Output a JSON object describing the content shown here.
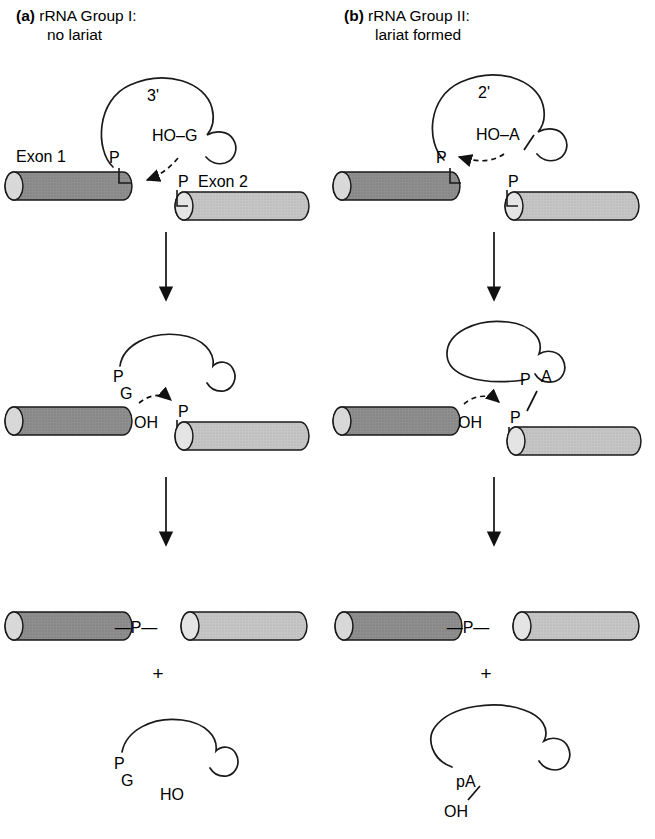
{
  "figure": {
    "type": "mechanism-diagram",
    "panel_count": 2,
    "stage_count": 3
  },
  "colors": {
    "exon1_fill": "#8f8f8f",
    "exon2_fill": "#c2c2c2",
    "cap_fill": "#d8d8d8",
    "stroke": "#1a1a1a",
    "background": "#ffffff"
  },
  "panels": [
    {
      "tag": "(a)",
      "title_line1": "rRNA Group I:",
      "title_line2": "no lariat",
      "stage1": {
        "loop_label": "3'",
        "nucleophile": "HO–G",
        "phosphate_left": "P",
        "phosphate_right": "P",
        "exon1_label": "Exon 1",
        "exon2_label": "Exon 2"
      },
      "stage2": {
        "intron_end_top": "P",
        "intron_end_bottom": "G",
        "exon1_end": "OH",
        "phosphate": "P"
      },
      "stage3": {
        "linkage": "—P—",
        "plus": "+",
        "released_top": "P",
        "released_bottom": "G",
        "released_end": "HO"
      }
    },
    {
      "tag": "(b)",
      "title_line1": "rRNA Group II:",
      "title_line2": "lariat formed",
      "stage1": {
        "loop_label": "2'",
        "nucleophile": "HO–A",
        "phosphate_left": "P",
        "phosphate_right": "P"
      },
      "stage2": {
        "branch_p": "P",
        "branch_a": "A",
        "exon1_end": "OH",
        "phosphate": "P"
      },
      "stage3": {
        "linkage": "—P—",
        "plus": "+",
        "lariat_branch": "pA",
        "lariat_oh": "OH"
      }
    }
  ],
  "arrows": {
    "transition_count": 4,
    "attack_arrow_style": "dashed-curved"
  }
}
